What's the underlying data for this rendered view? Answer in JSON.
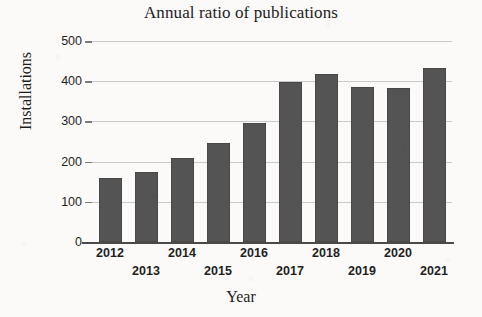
{
  "chart_data": {
    "type": "bar",
    "title": "Annual ratio of publications",
    "xlabel": "Year",
    "ylabel": "Installations",
    "categories": [
      "2012",
      "2013",
      "2014",
      "2015",
      "2016",
      "2017",
      "2018",
      "2019",
      "2020",
      "2021"
    ],
    "values": [
      160,
      175,
      208,
      246,
      297,
      397,
      418,
      385,
      383,
      433
    ],
    "ylim": [
      0,
      500
    ],
    "yticks": [
      0,
      100,
      200,
      300,
      400,
      500
    ],
    "ytick_labels": [
      "0",
      "100",
      "200",
      "300",
      "400",
      "500"
    ],
    "grid": true,
    "grid_axis": "y",
    "legend": false,
    "bar_color": "#545454",
    "gridline_color": "#c9c9c9",
    "axis_color": "#4a4a4a",
    "background_color": "#fbfaf8",
    "xtick_label_rows": [
      0,
      1,
      0,
      1,
      0,
      1,
      0,
      1,
      0,
      1
    ]
  }
}
